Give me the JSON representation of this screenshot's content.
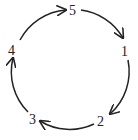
{
  "diagram": {
    "type": "cycle",
    "nodes": [
      {
        "id": "5",
        "label": "5"
      },
      {
        "id": "1",
        "label": "1"
      },
      {
        "id": "2",
        "label": "2"
      },
      {
        "id": "3",
        "label": "3"
      },
      {
        "id": "4",
        "label": "4"
      }
    ],
    "edges": [
      {
        "from": "5",
        "to": "1"
      },
      {
        "from": "1",
        "to": "2"
      },
      {
        "from": "2",
        "to": "3"
      },
      {
        "from": "3",
        "to": "4"
      },
      {
        "from": "4",
        "to": "5"
      }
    ]
  }
}
